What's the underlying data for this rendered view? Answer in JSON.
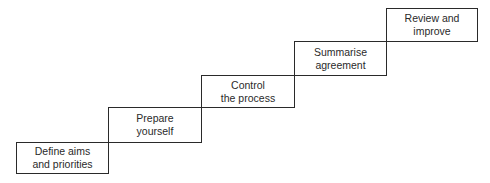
{
  "diagram": {
    "type": "staircase",
    "steps": [
      {
        "label": "Define aims\nand priorities",
        "x": 16,
        "y": 142,
        "w": 93,
        "h": 32
      },
      {
        "label": "Prepare\nyourself",
        "x": 108,
        "y": 107,
        "w": 94,
        "h": 36
      },
      {
        "label": "Control\nthe process",
        "x": 201,
        "y": 75,
        "w": 94,
        "h": 33
      },
      {
        "label": "Summarise\nagreement",
        "x": 294,
        "y": 41,
        "w": 93,
        "h": 35
      },
      {
        "label": "Review and\nimprove",
        "x": 386,
        "y": 8,
        "w": 92,
        "h": 34
      }
    ],
    "colors": {
      "stroke": "#2a2a2a",
      "fill": "#ffffff",
      "text": "#2a2a2a"
    }
  }
}
